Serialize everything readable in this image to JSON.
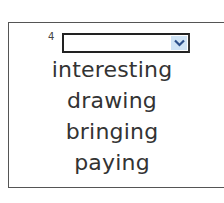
{
  "question": {
    "number": "4",
    "dropdown": {
      "selected": ""
    },
    "options": [
      "interesting",
      "drawing",
      "bringing",
      "paying"
    ]
  },
  "colors": {
    "dropdown_button": "#cfe3f5",
    "chevron": "#2b4f8a",
    "text": "#333333"
  }
}
